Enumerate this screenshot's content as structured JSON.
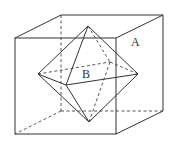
{
  "figure": {
    "labels": {
      "cube": "A",
      "octahedron": "B"
    },
    "colors": {
      "stroke": "#333333",
      "background": "#ffffff"
    },
    "cube": {
      "front_face": [
        [
          15,
          38
        ],
        [
          116,
          38
        ],
        [
          116,
          134
        ],
        [
          15,
          134
        ]
      ],
      "back_face": [
        [
          61,
          15
        ],
        [
          163,
          15
        ],
        [
          163,
          111
        ],
        [
          61,
          111
        ]
      ]
    },
    "octahedron": {
      "top": [
        88,
        26
      ],
      "bottom": [
        89,
        122
      ],
      "left": [
        38,
        74
      ],
      "right": [
        138,
        74
      ],
      "front": [
        66,
        85
      ],
      "back": [
        110,
        62
      ]
    },
    "label_positions": {
      "A": [
        131,
        46
      ],
      "B": [
        82,
        78
      ]
    }
  }
}
